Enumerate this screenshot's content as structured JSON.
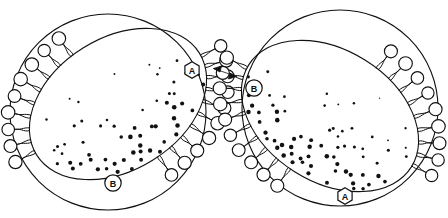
{
  "figure": {
    "background_color": "#ffffff",
    "ink_color": "#111111",
    "width": 448,
    "height": 218
  },
  "labels": {
    "left_top": "A",
    "left_bottom": "B",
    "right_top": "B",
    "right_bottom": "A"
  },
  "connector": {
    "name": "double-headed-arrow",
    "glyph": "↔"
  },
  "chart_data": {
    "type": "diagram",
    "panels": [
      {
        "id": "left",
        "name": "left-vesicle",
        "outer_circle": {
          "cx": 108,
          "cy": 112,
          "r": 98
        },
        "inner_ellipse": {
          "cx": 118,
          "cy": 104,
          "rx": 96,
          "ry": 66,
          "rotation_deg": -32
        },
        "lipid_arcs": [
          {
            "name": "upper-left-lipid-arc",
            "start_deg": 183,
            "end_deg": 262,
            "count": 9
          },
          {
            "name": "lower-right-lipid-arc",
            "start_deg": 3,
            "end_deg": 86,
            "count": 10
          }
        ],
        "gradient": {
          "dense_corner": "upper-right",
          "sparse_corner": "lower-left",
          "direction_deg": 58
        },
        "markers": [
          {
            "label": "A",
            "shape": "hexagon",
            "x": 192,
            "y": 70
          },
          {
            "label": "B",
            "shape": "circle",
            "x": 113,
            "y": 183
          }
        ]
      },
      {
        "id": "right",
        "name": "right-vesicle",
        "outer_circle": {
          "cx": 340,
          "cy": 108,
          "r": 98
        },
        "inner_ellipse": {
          "cx": 330,
          "cy": 116,
          "rx": 96,
          "ry": 66,
          "rotation_deg": 32
        },
        "lipid_arcs": [
          {
            "name": "upper-right-lipid-arc",
            "start_deg": 358,
            "end_deg": 279,
            "count": 9
          },
          {
            "name": "lower-left-lipid-arc",
            "start_deg": 177,
            "end_deg": 94,
            "count": 10
          }
        ],
        "gradient": {
          "dense_corner": "lower-right",
          "sparse_corner": "upper-left",
          "direction_deg": 122
        },
        "markers": [
          {
            "label": "B",
            "shape": "circle",
            "x": 254,
            "y": 88
          },
          {
            "label": "A",
            "shape": "hexagon",
            "x": 345,
            "y": 196
          }
        ]
      }
    ],
    "legend": [],
    "xlabel": "",
    "ylabel": ""
  }
}
